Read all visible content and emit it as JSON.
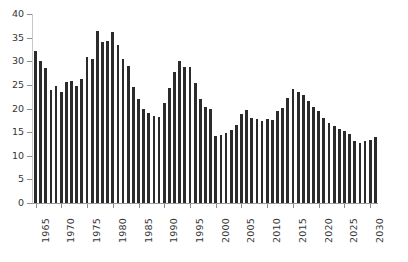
{
  "chart_data": {
    "type": "bar",
    "title": "",
    "subtitle": "",
    "xlabel": "",
    "ylabel": "",
    "xlim": [
      1964.5,
      2031.5
    ],
    "ylim": [
      0,
      40
    ],
    "grid": false,
    "legend": null,
    "bar_color": "#2b2b2b",
    "axis_color": "#9a9a9a",
    "y_ticks": [
      0,
      5,
      10,
      15,
      20,
      25,
      30,
      35,
      40
    ],
    "y_tick_labels": [
      "0",
      "5",
      "10",
      "15",
      "20",
      "25",
      "30",
      "35",
      "40"
    ],
    "x_ticks": [
      1965,
      1970,
      1975,
      1980,
      1985,
      1990,
      1995,
      2000,
      2005,
      2010,
      2015,
      2020,
      2025,
      2030
    ],
    "x_tick_labels": [
      "1965",
      "1970",
      "1975",
      "1980",
      "1985",
      "1990",
      "1995",
      "2000",
      "2005",
      "2010",
      "2015",
      "2020",
      "2025",
      "2030"
    ],
    "categories": [
      "1965",
      "1966",
      "1967",
      "1968",
      "1969",
      "1970",
      "1971",
      "1972",
      "1973",
      "1974",
      "1975",
      "1976",
      "1977",
      "1978",
      "1979",
      "1980",
      "1981",
      "1982",
      "1983",
      "1984",
      "1985",
      "1986",
      "1987",
      "1988",
      "1989",
      "1990",
      "1991",
      "1992",
      "1993",
      "1994",
      "1995",
      "1996",
      "1997",
      "1998",
      "1999",
      "2000",
      "2001",
      "2002",
      "2003",
      "2004",
      "2005",
      "2006",
      "2007",
      "2008",
      "2009",
      "2010",
      "2011",
      "2012",
      "2013",
      "2014",
      "2015",
      "2016",
      "2017",
      "2018",
      "2019",
      "2020",
      "2021",
      "2022",
      "2023",
      "2024",
      "2025",
      "2026",
      "2027",
      "2028",
      "2029",
      "2030",
      "2031"
    ],
    "values": [
      32.1,
      30.0,
      28.6,
      24.0,
      24.8,
      23.5,
      25.6,
      25.8,
      24.8,
      26.2,
      31.0,
      30.5,
      36.3,
      34.1,
      34.2,
      36.2,
      33.4,
      30.4,
      29.0,
      24.5,
      22.1,
      20.0,
      19.0,
      18.5,
      18.2,
      21.2,
      24.4,
      27.8,
      30.0,
      28.8,
      28.7,
      25.3,
      22.0,
      20.4,
      20.0,
      14.2,
      14.4,
      14.8,
      15.4,
      16.6,
      18.8,
      19.6,
      18.0,
      17.7,
      17.4,
      17.8,
      17.6,
      19.4,
      20.2,
      22.2,
      24.2,
      23.4,
      22.8,
      21.6,
      20.4,
      19.4,
      18.0,
      17.0,
      16.2,
      15.6,
      15.2,
      14.6,
      13.2,
      12.8,
      13.1,
      13.4,
      14.0
    ]
  }
}
